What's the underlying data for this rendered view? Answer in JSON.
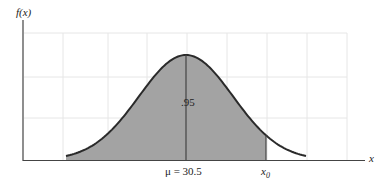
{
  "figure": {
    "partial_mark": "",
    "y_axis_label": "f(x)",
    "x_axis_label": "x",
    "area_label": ".95",
    "mean_label": "μ = 30.5",
    "x0_label_base": "x",
    "x0_label_sub": "0"
  },
  "colors": {
    "shade": "#a3a3a3",
    "curve": "#2a2a2a",
    "axis": "#444444",
    "grid": "#e6e6e6"
  },
  "chart_data": {
    "type": "area",
    "title": "",
    "mean": 30.5,
    "shaded_area": 0.95,
    "shaded_region": "x < x0",
    "xlabel": "x",
    "ylabel": "f(x)",
    "annotations": [
      ".95",
      "μ = 30.5",
      "x0"
    ],
    "grid": true
  }
}
